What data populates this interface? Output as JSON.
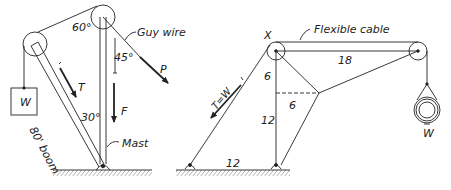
{
  "left_figure": {
    "labels": {
      "angle_top": "60°",
      "angle_guy": "45°",
      "angle_mast": "30°",
      "guy_wire": "Guy wire",
      "force_p": "P",
      "force_t": "T",
      "force_f": "F",
      "weight": "W",
      "boom": "80' boom",
      "mast": "Mast"
    }
  },
  "right_figure": {
    "labels": {
      "joint_x": "X",
      "flexible_cable": "Flexible cable",
      "dim_18": "18",
      "dim_6_upper": "6",
      "dim_6_horizontal": "6",
      "dim_12_vertical": "12",
      "dim_12_base": "12",
      "tension": "T=W",
      "weight": "W"
    }
  },
  "colors": {
    "ink": "#222222",
    "background": "#ffffff"
  }
}
